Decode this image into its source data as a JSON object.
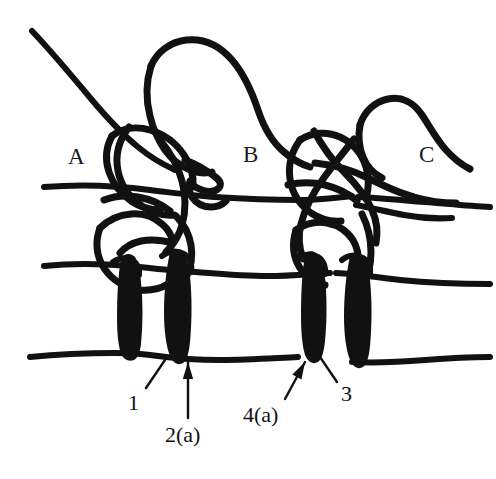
{
  "figure": {
    "kind": "anatomical-line-drawing",
    "width": 496,
    "height": 479,
    "background_color": "#ffffff",
    "ink_color": "#111111"
  },
  "region_labels": [
    {
      "id": "A",
      "text": "A",
      "x": 68,
      "y": 145
    },
    {
      "id": "B",
      "text": "B",
      "x": 243,
      "y": 143
    },
    {
      "id": "C",
      "text": "C",
      "x": 419,
      "y": 143
    }
  ],
  "callouts": [
    {
      "id": "1",
      "text": "1",
      "label_x": 128,
      "label_y": 392,
      "arrow_type": "plain-line",
      "arrow_from": [
        146,
        388
      ],
      "arrow_to": [
        165,
        360
      ]
    },
    {
      "id": "2a",
      "text": "2(a)",
      "label_x": 165,
      "label_y": 424,
      "arrow_type": "arrowhead",
      "arrow_from": [
        188,
        418
      ],
      "arrow_to": [
        188,
        362
      ]
    },
    {
      "id": "3",
      "text": "3",
      "label_x": 341,
      "label_y": 383,
      "arrow_type": "plain-line",
      "arrow_from": [
        337,
        382
      ],
      "arrow_to": [
        320,
        357
      ]
    },
    {
      "id": "4a",
      "text": "4(a)",
      "label_x": 243,
      "label_y": 404,
      "arrow_type": "arrowhead",
      "arrow_from": [
        285,
        399
      ],
      "arrow_to": [
        305,
        362
      ]
    }
  ],
  "graphics": {
    "horizontal_lines": [
      {
        "name": "upper-horizontal-line",
        "path": "M 44 187 C 80 184 120 186 150 190 C 175 193 195 196 215 197 C 245 199 275 200 300 200 C 318 200 335 198 352 196",
        "width": 6
      },
      {
        "name": "upper-horizontal-line-right",
        "path": "M 358 197 C 380 198 400 200 425 202 C 450 204 470 206 490 207",
        "width": 6
      },
      {
        "name": "middle-horizontal-line",
        "path": "M 44 266 C 75 263 105 264 130 266 C 150 268 165 270 182 271 C 210 273 240 276 268 276 C 290 276 310 274 330 273",
        "width": 6
      },
      {
        "name": "middle-horizontal-line-right",
        "path": "M 336 273 C 355 274 375 277 400 280 C 430 283 460 284 490 284",
        "width": 6
      },
      {
        "name": "lower-horizontal-line",
        "path": "M 30 357 C 60 354 90 353 115 353 C 130 353 145 354 158 356 C 180 359 200 360 220 360 C 250 360 275 358 298 357",
        "width": 6
      },
      {
        "name": "lower-horizontal-line-right",
        "path": "M 352 362 C 375 363 400 362 425 360 C 450 358 472 357 490 357",
        "width": 6
      }
    ],
    "upper_left_diagonal": {
      "name": "upper-left-diagonal-curve",
      "path": "M 32 31 C 52 52 72 76 92 100 C 108 119 122 134 138 147 C 150 157 162 164 175 170",
      "width": 6
    },
    "upper_lobe_center": {
      "name": "center-upper-lobe",
      "path": "M 151 66 C 157 52 170 42 186 40 C 204 38 220 46 232 60 C 244 74 252 92 258 110 C 264 128 272 142 284 152 C 292 159 300 164 310 167",
      "width": 7
    },
    "center_lobe_inner": {
      "name": "center-lobe-inner-edge",
      "path": "M 151 66 C 146 82 146 100 150 116 C 153 129 158 140 165 150 C 172 160 180 166 190 170 C 198 173 205 174 212 172",
      "width": 7
    },
    "center_hook": {
      "name": "center-hook-shape",
      "path": "M 185 160 C 196 164 206 170 214 176 C 220 180 222 184 219 188 C 215 192 208 192 202 190 C 196 188 192 185 190 181 C 188 186 189 192 192 197 C 196 203 203 207 211 207 C 217 207 222 205 226 201",
      "width": 7
    },
    "upper_right_lobe": {
      "name": "upper-right-lobe",
      "path": "M 360 125 C 364 112 374 102 388 99 C 402 96 414 103 422 115 C 430 127 437 140 446 150 C 454 159 462 165 470 169",
      "width": 7
    },
    "upper_right_lobe_inner": {
      "name": "upper-right-lobe-inner",
      "path": "M 360 125 C 358 136 359 147 363 157 C 367 167 374 174 382 178",
      "width": 7
    },
    "right_sweep": {
      "name": "right-sweep-curve",
      "path": "M 315 163 C 334 165 352 170 368 178 C 384 186 398 193 414 197 C 428 201 442 203 456 203",
      "width": 7
    },
    "right_sweep_lower": {
      "name": "right-sweep-lower-curve",
      "path": "M 356 205 C 372 208 388 212 404 215 C 420 218 436 219 452 218",
      "width": 6
    },
    "left_cluster": [
      {
        "name": "left-cluster-arc-1",
        "path": "M 112 136 C 122 128 136 126 150 130 C 164 134 176 143 184 155 C 191 165 194 176 193 187",
        "width": 7
      },
      {
        "name": "left-cluster-arc-2",
        "path": "M 112 136 C 106 147 105 160 109 172 C 113 184 121 194 131 201 C 140 207 150 210 160 210",
        "width": 7
      },
      {
        "name": "left-cluster-arc-3",
        "path": "M 129 127 C 119 140 115 156 118 171 C 121 186 130 198 142 206 C 152 213 163 216 174 215",
        "width": 7
      },
      {
        "name": "left-cluster-arc-4",
        "path": "M 160 140 C 170 152 178 166 182 181 C 186 196 186 211 182 225 C 179 236 173 245 166 252",
        "width": 7
      },
      {
        "name": "left-cluster-arc-5",
        "path": "M 104 200 C 114 196 126 195 138 197 C 150 199 161 204 170 211",
        "width": 7
      },
      {
        "name": "left-cluster-lower-loop",
        "path": "M 100 228 C 95 241 96 256 104 268 C 112 280 125 288 139 290 C 150 291 160 289 168 284",
        "width": 7
      },
      {
        "name": "left-cluster-lower-loop-inner",
        "path": "M 100 228 C 108 220 119 215 131 214 C 143 213 154 217 162 224 C 168 229 172 236 173 243 C 162 240 151 239 141 241 C 132 243 125 247 120 253",
        "width": 7
      },
      {
        "name": "left-cluster-right-spur",
        "path": "M 176 216 C 184 224 189 234 191 245 C 193 257 191 268 186 278",
        "width": 7
      }
    ],
    "right_cluster": [
      {
        "name": "right-cluster-arc-1",
        "path": "M 300 140 C 312 132 327 131 340 137 C 353 143 362 154 366 167 C 369 177 369 188 366 198",
        "width": 7
      },
      {
        "name": "right-cluster-arc-2",
        "path": "M 300 140 C 292 151 288 165 290 179 C 292 193 300 205 311 213 C 320 219 331 222 341 221",
        "width": 7
      },
      {
        "name": "right-cluster-arc-3",
        "path": "M 314 131 C 322 146 332 160 344 172 C 356 184 366 196 372 210 C 377 221 378 232 376 243",
        "width": 7
      },
      {
        "name": "right-cluster-arc-4",
        "path": "M 354 139 C 344 152 333 165 323 179 C 313 193 305 208 301 224 C 298 236 299 248 303 259",
        "width": 7
      },
      {
        "name": "right-cluster-arc-5",
        "path": "M 288 185 C 300 182 313 182 325 185 C 337 188 348 193 357 201",
        "width": 7
      },
      {
        "name": "right-cluster-lower-curve",
        "path": "M 296 230 C 292 243 293 257 300 268 C 306 277 315 283 325 285",
        "width": 7
      },
      {
        "name": "right-cluster-lower-hook",
        "path": "M 296 230 C 305 224 316 221 327 223 C 338 225 347 231 353 240 C 357 247 359 255 358 263",
        "width": 7
      },
      {
        "name": "right-cluster-descend",
        "path": "M 362 214 C 368 226 371 239 371 252 C 371 265 368 277 362 287",
        "width": 7
      }
    ],
    "vertical_bones": [
      {
        "name": "bone-left-outer",
        "outline": "M 121 258 C 118 276 117 296 117 316 C 117 332 118 344 121 354 C 124 360 129 362 134 360 C 138 358 140 352 141 344 C 143 324 143 302 141 282 C 140 270 138 262 135 257 C 131 253 125 253 121 258 Z",
        "highlight": "M 128 268 C 126 284 125 302 125 318 C 125 332 126 342 128 350"
      },
      {
        "name": "bone-left-inner",
        "outline": "M 170 252 C 166 270 164 292 164 312 C 164 330 166 346 170 356 C 173 363 178 366 183 363 C 187 360 189 352 190 342 C 192 320 192 296 190 276 C 188 262 185 254 181 251 C 177 248 173 249 170 252 Z",
        "highlight": "M 177 264 C 175 282 174 302 174 320 C 174 336 175 348 177 356"
      },
      {
        "name": "bone-right-outer",
        "outline": "M 305 255 C 302 273 301 294 301 314 C 301 331 302 345 305 355 C 308 362 313 365 318 362 C 322 359 324 351 325 341 C 327 320 327 297 325 277 C 323 263 320 256 316 253 C 312 250 308 251 305 255 Z",
        "highlight": "M 312 266 C 310 284 309 303 309 320 C 309 335 310 346 312 354"
      },
      {
        "name": "bone-right-inner",
        "outline": "M 350 256 C 346 274 344 296 344 316 C 344 334 346 350 350 360 C 353 367 358 370 363 367 C 367 364 369 356 370 346 C 372 324 372 300 370 280 C 368 266 365 258 361 255 C 357 252 353 253 350 256 Z",
        "highlight": "M 357 268 C 355 286 354 306 354 324 C 354 340 355 352 357 360"
      }
    ],
    "notch_details": [
      {
        "name": "notch-left-outer",
        "path": "M 113 262 C 118 258 126 257 132 260 C 137 263 140 269 139 275",
        "width": 6
      },
      {
        "name": "notch-left-inner",
        "path": "M 162 256 C 168 251 177 250 184 254 C 190 258 192 265 191 272",
        "width": 6
      },
      {
        "name": "notch-right-outer",
        "path": "M 297 259 C 303 254 311 253 318 257 C 324 261 326 268 325 274",
        "width": 6
      },
      {
        "name": "notch-right-inner",
        "path": "M 342 260 C 348 255 356 254 363 258 C 369 262 371 269 370 275",
        "width": 6
      }
    ]
  }
}
